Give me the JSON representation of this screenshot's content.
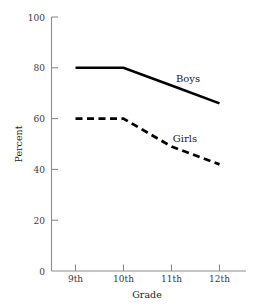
{
  "chart_data": {
    "type": "line",
    "title": "",
    "xlabel": "Grade",
    "ylabel": "Percent",
    "categories": [
      "9th",
      "10th",
      "11th",
      "12th"
    ],
    "x": [
      9,
      10,
      11,
      12
    ],
    "xtick_labels": [
      "9th",
      "10th",
      "11th",
      "12th"
    ],
    "ytick_labels": [
      "0",
      "20",
      "40",
      "60",
      "80",
      "100"
    ],
    "yticks": [
      0,
      20,
      40,
      60,
      80,
      100
    ],
    "ylim": [
      0,
      100
    ],
    "grid": false,
    "legend_position": "inline-labels",
    "series": [
      {
        "name": "Boys",
        "style": "solid",
        "color": "#000000",
        "values": [
          80,
          80,
          73,
          66
        ]
      },
      {
        "name": "Girls",
        "style": "dashed",
        "color": "#000000",
        "values": [
          60,
          60,
          49,
          42
        ]
      }
    ],
    "annotations": [
      {
        "text": "Boys",
        "series": "Boys",
        "x": 11.1,
        "y": 77
      },
      {
        "text": "Girls",
        "series": "Girls",
        "x": 11.05,
        "y": 53
      }
    ]
  },
  "axis": {
    "y_title": "Percent",
    "x_title": "Grade",
    "y_tick_100": "100",
    "y_tick_80": "80",
    "y_tick_60": "60",
    "y_tick_40": "40",
    "y_tick_20": "20",
    "y_tick_0": "0",
    "x_tick_9": "9th",
    "x_tick_10": "10th",
    "x_tick_11": "11th",
    "x_tick_12": "12th"
  },
  "labels": {
    "boys": "Boys",
    "girls": "Girls"
  },
  "colors": {
    "line": "#000000",
    "axis": "#8c8c8c",
    "text": "#231f20",
    "background": "#ffffff"
  }
}
